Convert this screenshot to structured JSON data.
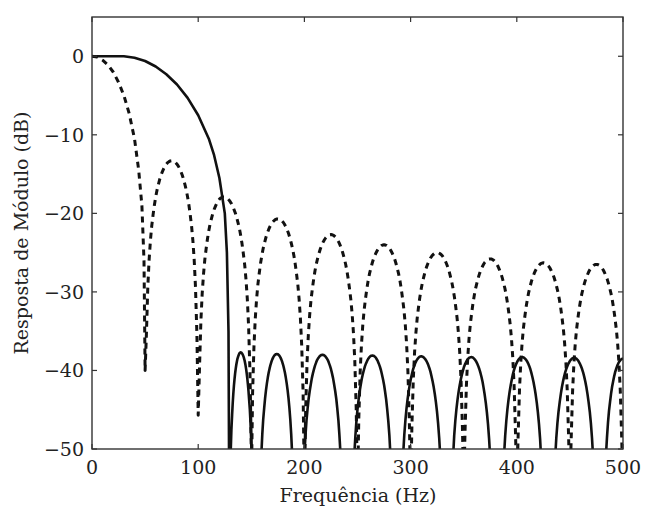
{
  "chart_data": {
    "type": "line",
    "title": "",
    "xlabel": "Frequência (Hz)",
    "ylabel": "Resposta de Módulo (dB)",
    "xlim": [
      0,
      500
    ],
    "ylim": [
      -50,
      5
    ],
    "xticks": [
      0,
      100,
      200,
      300,
      400,
      500
    ],
    "xtick_labels": [
      "0",
      "100",
      "200",
      "300",
      "400",
      "500"
    ],
    "yticks": [
      0,
      -10,
      -20,
      -30,
      -40,
      -50
    ],
    "ytick_labels": [
      "0",
      "−10",
      "−20",
      "−30",
      "−40",
      "−50"
    ],
    "grid": false,
    "legend": null,
    "series": [
      {
        "name": "solid",
        "style": "solid",
        "color": "#111111",
        "main_lobe": {
          "flat_until_hz": 30,
          "points": [
            [
              0,
              0
            ],
            [
              20,
              0
            ],
            [
              30,
              0
            ],
            [
              40,
              -0.2
            ],
            [
              50,
              -0.6
            ],
            [
              60,
              -1.3
            ],
            [
              70,
              -2.3
            ],
            [
              80,
              -3.6
            ],
            [
              90,
              -5.3
            ],
            [
              100,
              -7.5
            ],
            [
              110,
              -10.5
            ],
            [
              115,
              -12.6
            ],
            [
              120,
              -15.5
            ],
            [
              125,
              -20
            ],
            [
              127,
              -25
            ],
            [
              128.5,
              -35
            ],
            [
              129,
              -50
            ]
          ]
        },
        "sidelobes": [
          {
            "null_start": 129,
            "peak_hz": 140,
            "peak_db": -37.7,
            "null_end": 152
          },
          {
            "null_start": 157,
            "peak_hz": 174,
            "peak_db": -37.9,
            "null_end": 191
          },
          {
            "null_start": 197,
            "peak_hz": 217,
            "peak_db": -38.0,
            "null_end": 237
          },
          {
            "null_start": 244,
            "peak_hz": 264,
            "peak_db": -38.1,
            "null_end": 284
          },
          {
            "null_start": 290,
            "peak_hz": 310,
            "peak_db": -38.2,
            "null_end": 331
          },
          {
            "null_start": 337,
            "peak_hz": 357,
            "peak_db": -38.3,
            "null_end": 378
          },
          {
            "null_start": 385,
            "peak_hz": 405,
            "peak_db": -38.3,
            "null_end": 426
          },
          {
            "null_start": 433,
            "peak_hz": 454,
            "peak_db": -38.4,
            "null_end": 475
          },
          {
            "null_start": 481,
            "peak_hz": 500,
            "peak_db": -38.5,
            "null_end": 520
          }
        ]
      },
      {
        "name": "dashed",
        "style": "dashed",
        "color": "#111111",
        "main_lobe": {
          "points": [
            [
              0,
              0
            ],
            [
              5,
              -0.1
            ],
            [
              10,
              -0.5
            ],
            [
              15,
              -1.1
            ],
            [
              20,
              -2.0
            ],
            [
              25,
              -3.3
            ],
            [
              30,
              -5.0
            ],
            [
              35,
              -7.3
            ],
            [
              40,
              -10.5
            ],
            [
              44,
              -14.5
            ],
            [
              47,
              -19
            ],
            [
              49,
              -26
            ],
            [
              50,
              -40
            ]
          ]
        },
        "sidelobes": [
          {
            "null_start": 50,
            "null_start_db": -40,
            "peak_hz": 75,
            "peak_db": -13.3,
            "null_end": 100,
            "null_end_db": -45.7
          },
          {
            "null_start": 100,
            "null_start_db": -45.7,
            "peak_hz": 124,
            "peak_db": -17.9,
            "null_end": 150,
            "null_end_db": -50
          },
          {
            "null_start": 150,
            "peak_hz": 175,
            "peak_db": -20.7,
            "null_end": 200
          },
          {
            "null_start": 200,
            "peak_hz": 225,
            "peak_db": -22.7,
            "null_end": 250
          },
          {
            "null_start": 250,
            "peak_hz": 275,
            "peak_db": -24.0,
            "null_end": 300
          },
          {
            "null_start": 300,
            "peak_hz": 325,
            "peak_db": -25.0,
            "null_end": 350
          },
          {
            "null_start": 350,
            "peak_hz": 375,
            "peak_db": -25.8,
            "null_end": 400
          },
          {
            "null_start": 400,
            "peak_hz": 425,
            "peak_db": -26.3,
            "null_end": 450
          },
          {
            "null_start": 450,
            "peak_hz": 475,
            "peak_db": -26.5,
            "null_end": 500
          }
        ]
      }
    ]
  },
  "axes": {
    "xlabel": "Frequência (Hz)",
    "ylabel": "Resposta de Módulo (dB)"
  }
}
